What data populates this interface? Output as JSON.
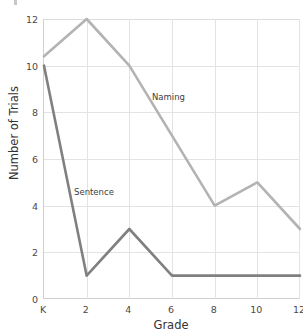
{
  "chart_data": {
    "type": "line",
    "title": "",
    "xlabel": "Grade",
    "ylabel": "Number of Trials",
    "categories": [
      "K",
      "2",
      "4",
      "6",
      "8",
      "10",
      "12"
    ],
    "x": [
      0,
      2,
      4,
      6,
      8,
      10,
      12
    ],
    "xlim": [
      0,
      12
    ],
    "ylim": [
      0,
      12
    ],
    "yticks": [
      0,
      2,
      4,
      6,
      8,
      10,
      12
    ],
    "xticks": [
      "K",
      "2",
      "4",
      "6",
      "8",
      "10",
      "12"
    ],
    "grid": true,
    "legend": "inline-annotations",
    "series": [
      {
        "name": "Naming",
        "color": "#b3b3b3",
        "values": [
          10.4,
          12,
          10,
          7,
          4,
          5,
          3
        ],
        "label_position": {
          "x": 155,
          "y": 97
        }
      },
      {
        "name": "Sentence",
        "color": "#808080",
        "values": [
          10,
          1,
          3,
          1,
          1,
          1,
          1
        ],
        "label_position": {
          "x": 78,
          "y": 192
        }
      }
    ],
    "annotations": [
      {
        "text": "Naming",
        "series": "Naming"
      },
      {
        "text": "Sentence",
        "series": "Sentence"
      }
    ]
  },
  "axes": {
    "y_title": "Number of Trials",
    "x_title": "Grade",
    "y_tick_labels": [
      "12",
      "10",
      "8",
      "6",
      "4",
      "2",
      "0"
    ],
    "x_tick_labels": [
      "K",
      "2",
      "4",
      "6",
      "8",
      "10",
      "12"
    ]
  },
  "colors": {
    "naming_line": "#b3b3b3",
    "sentence_line": "#808080",
    "gridline": "#e3e3e3",
    "axis": "#cfcfcf",
    "text": "#4a4a4a",
    "background": "#ffffff"
  }
}
